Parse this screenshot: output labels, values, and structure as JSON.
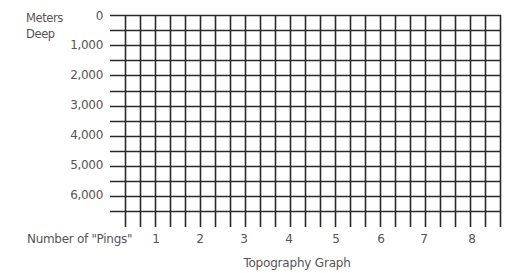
{
  "chart_data": {
    "type": "table",
    "title": "Topography Graph",
    "xlabel": "Number of \"Pings\"",
    "ylabel": "Meters Deep",
    "x_ticks": [
      "1",
      "2",
      "3",
      "4",
      "5",
      "6",
      "7",
      "8"
    ],
    "y_ticks": [
      "0",
      "1,000",
      "2,000",
      "3,000",
      "4,000",
      "5,000",
      "6,000"
    ],
    "ylim": [
      0,
      6500
    ],
    "y_inverted": true,
    "grid": true,
    "grid_vertical_lines": 26,
    "grid_horizontal_lines": 14,
    "series": [],
    "note": "Blank grid worksheet for plotting ocean depth soundings"
  },
  "labels": {
    "ylabel_line1": "Meters",
    "ylabel_line2": "Deep",
    "xlabel": "Number of \"Pings\"",
    "title": "Topography Graph"
  },
  "colors": {
    "grid": "#2a2a2a",
    "text": "#555555"
  }
}
